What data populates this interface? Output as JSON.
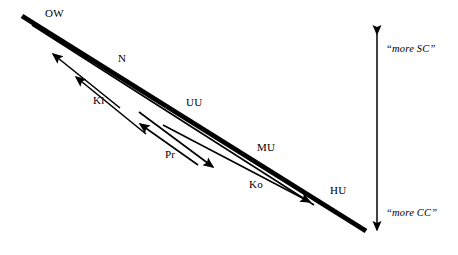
{
  "diagram": {
    "background_color": "#ffffff",
    "stroke_color": "#000000",
    "main_axis": {
      "name": "thick-diagonal-axis",
      "from": [
        22,
        16
      ],
      "to": [
        366,
        231
      ],
      "thickness": 5
    },
    "node_labels": [
      {
        "id": "OW",
        "text": "OW",
        "x": 45,
        "y": 8
      },
      {
        "id": "N",
        "text": "N",
        "x": 118,
        "y": 53
      },
      {
        "id": "Kl",
        "text": "Kl",
        "x": 93,
        "y": 95
      },
      {
        "id": "UU",
        "text": "UU",
        "x": 186,
        "y": 97
      },
      {
        "id": "Pr",
        "text": "Pr",
        "x": 165,
        "y": 149
      },
      {
        "id": "MU",
        "text": "MU",
        "x": 257,
        "y": 142
      },
      {
        "id": "Ko",
        "text": "Ko",
        "x": 249,
        "y": 179
      },
      {
        "id": "HU",
        "text": "HU",
        "x": 330,
        "y": 185
      }
    ],
    "arrows": [
      {
        "id": "arrow-kl-up",
        "from": [
          118,
          107
        ],
        "to": [
          50,
          52
        ],
        "head": "end"
      },
      {
        "id": "arrow-n-up",
        "from": [
          142,
          131
        ],
        "to": [
          73,
          74
        ],
        "head": "end"
      },
      {
        "id": "arrow-pr-left",
        "from": [
          196,
          163
        ],
        "to": [
          137,
          121
        ],
        "head": "end"
      },
      {
        "id": "arrow-pr-right",
        "from": [
          136,
          109
        ],
        "to": [
          215,
          168
        ],
        "head": "end"
      },
      {
        "id": "arrow-ko-right",
        "from": [
          160,
          123
        ],
        "to": [
          312,
          203
        ],
        "head": "end"
      },
      {
        "id": "arrow-parallel-long",
        "from": [
          32,
          25
        ],
        "to": [
          314,
          205
        ],
        "head": "none"
      }
    ],
    "vertical_scale": {
      "name": "vertical-double-arrow",
      "x": 377,
      "top_y": 28,
      "bottom_y": 236,
      "top_label": "“more SC”",
      "bottom_label": "“more CC”",
      "top_label_x": 386,
      "top_label_y": 44,
      "bottom_label_x": 386,
      "bottom_label_y": 208
    }
  }
}
